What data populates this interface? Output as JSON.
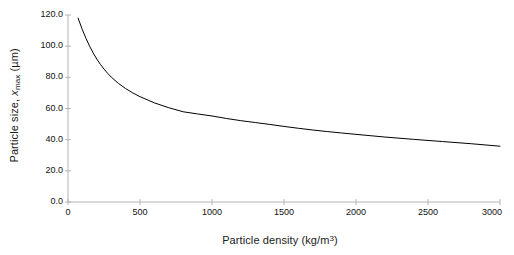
{
  "chart_data": {
    "type": "line",
    "title": "",
    "subtitle": "",
    "xlabel": "Particle density (kg/m3)",
    "xlabel_parts": {
      "text": "Particle density (kg/m",
      "sup": "3",
      "tail": ")"
    },
    "ylabel": "Particle size, xmax (µm)",
    "ylabel_parts": {
      "pre": "Particle size, ",
      "italic": "x",
      "sub": "max",
      "post": " (µm)"
    },
    "xlim": [
      0,
      3000
    ],
    "ylim": [
      0,
      120
    ],
    "xticks": [
      0,
      500,
      1000,
      1500,
      2000,
      2500,
      3000
    ],
    "xtick_labels": [
      "0",
      "500",
      "1000",
      "1500",
      "2000",
      "2500",
      "3000"
    ],
    "yticks": [
      0,
      20,
      40,
      60,
      80,
      100,
      120
    ],
    "ytick_labels": [
      "0.0",
      "20.0",
      "40.0",
      "60.0",
      "80.0",
      "100.0",
      "120.0"
    ],
    "grid": false,
    "legend": null,
    "legend_position": "none",
    "line_color": "#000000",
    "line_width": 1.0,
    "axis_color": "#b4b4b4",
    "background": "#ffffff",
    "series": [
      {
        "name": "x_max vs particle density",
        "x": [
          70,
          100,
          125,
          150,
          175,
          200,
          225,
          250,
          275,
          300,
          350,
          400,
          450,
          500,
          600,
          700,
          800,
          900,
          1000,
          1100,
          1200,
          1300,
          1400,
          1500,
          1600,
          1700,
          1800,
          1900,
          2000,
          2200,
          2400,
          2600,
          2800,
          3000
        ],
        "y": [
          118.0,
          110.5,
          105.0,
          100.0,
          95.6,
          91.7,
          88.3,
          85.3,
          82.6,
          80.2,
          76.1,
          72.8,
          70.0,
          67.6,
          63.6,
          60.5,
          57.9,
          56.5,
          55.2,
          53.6,
          52.2,
          51.0,
          49.8,
          48.5,
          47.3,
          46.2,
          45.2,
          44.3,
          43.4,
          41.7,
          40.2,
          38.8,
          37.4,
          35.8
        ]
      }
    ]
  },
  "axis_geometry": {
    "plot_left": 68,
    "plot_right": 500,
    "plot_top": 15,
    "plot_bottom": 202
  }
}
